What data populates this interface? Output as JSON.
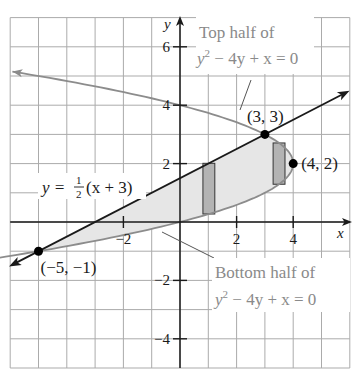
{
  "figure": {
    "colors": {
      "grid": "#ababab",
      "axes": "#1a1a1a",
      "line": "#1a1a1a",
      "curve": "#8c8c8c",
      "region_fill": "#e6e6e6",
      "rect_fill": "#b3b3b3",
      "rect_stroke": "#333333",
      "gray_label": "#8a8a8a",
      "point": "#000000"
    },
    "axes": {
      "x_label": "x",
      "y_label": "y",
      "x_ticks": [
        {
          "value": -2,
          "label": "−2"
        },
        {
          "value": 2,
          "label": "2"
        },
        {
          "value": 4,
          "label": "4"
        }
      ],
      "y_ticks": [
        {
          "value": 6,
          "label": "6"
        },
        {
          "value": 4,
          "label": "4"
        },
        {
          "value": 2,
          "label": "2"
        },
        {
          "value": -2,
          "label": "−2"
        },
        {
          "value": -4,
          "label": "−4"
        }
      ],
      "xlim": [
        -6,
        6
      ],
      "ylim": [
        -5,
        7
      ],
      "grid_step": 1
    },
    "labels": {
      "line_eq_prefix": "y = ",
      "line_eq_num": "1",
      "line_eq_den": "2",
      "line_eq_suffix": "(x + 3)",
      "top_half_line1": "Top half of",
      "top_half_line2_y": "y",
      "top_half_line2_sup": "2",
      "top_half_line2_rest": " − 4y + x = 0",
      "bottom_half_line1": "Bottom half of",
      "bottom_half_line2_y": "y",
      "bottom_half_line2_sup": "2",
      "bottom_half_line2_rest": " − 4y + x = 0"
    },
    "points": [
      {
        "label": "(−5, −1)",
        "x": -5,
        "y": -1
      },
      {
        "label": "(3, 3)",
        "x": 3,
        "y": 3
      },
      {
        "label": "(4, 2)",
        "x": 4,
        "y": 2
      }
    ],
    "rectangles": [
      {
        "x_center": 1,
        "note": "vertical strip from lower curve to line"
      },
      {
        "x_center": 3.5,
        "note": "vertical strip between lower and upper halves"
      }
    ]
  }
}
